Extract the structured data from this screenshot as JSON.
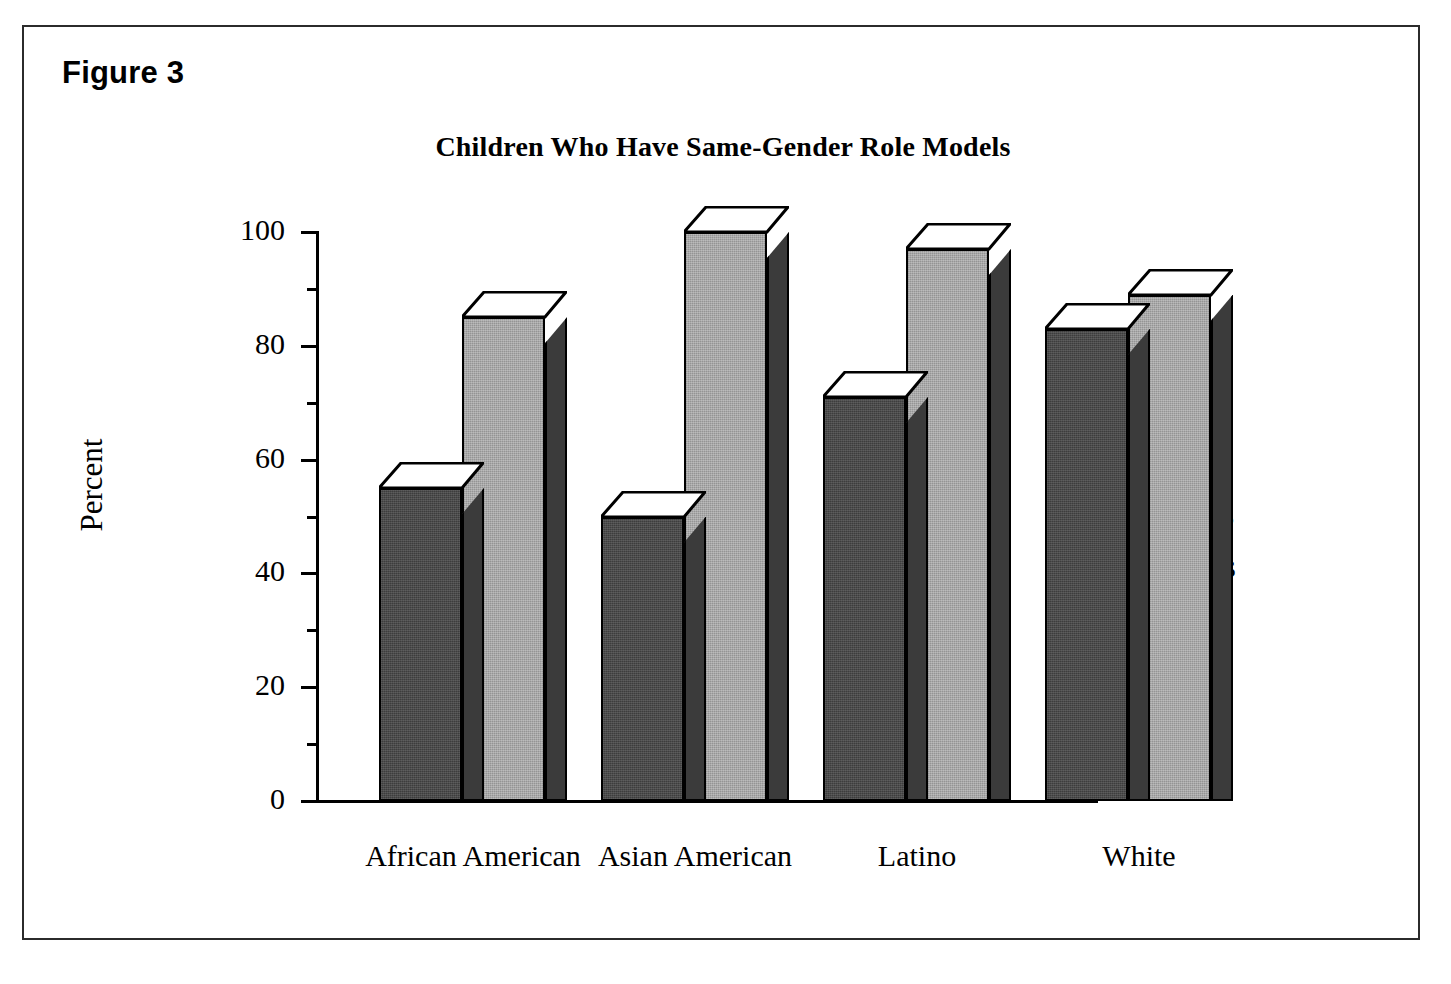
{
  "figure": {
    "caption": "Figure 3"
  },
  "chart_data": {
    "type": "bar",
    "title": "Children Who Have Same-Gender Role Models",
    "xlabel": "",
    "ylabel": "Percent",
    "ylim": [
      0,
      100
    ],
    "grid": false,
    "legend_position": "right",
    "style": "3d-clustered-column",
    "categories": [
      "African American",
      "Asian American",
      "Latino",
      "White"
    ],
    "y_ticks_major": [
      0,
      20,
      40,
      60,
      80,
      100
    ],
    "y_tick_labels": [
      "0",
      "20",
      "40",
      "60",
      "80",
      "100"
    ],
    "y_ticks_minor": [
      10,
      30,
      50,
      70,
      90
    ],
    "series": [
      {
        "name": "Girls",
        "color": "#3d3d3d",
        "values": [
          55,
          50,
          71,
          83
        ]
      },
      {
        "name": "Boys",
        "color": "#a8a8a8",
        "values": [
          85,
          100,
          97,
          89
        ]
      }
    ]
  }
}
